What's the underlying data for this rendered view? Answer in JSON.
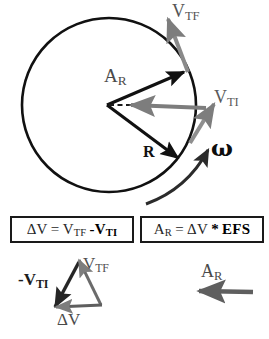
{
  "figure": {
    "background_color": "#ffffff"
  },
  "circle_diagram": {
    "labels": {
      "v_tf": {
        "base": "V",
        "sub": "TF",
        "color": "#555555"
      },
      "a_r": {
        "base": "A",
        "sub": "R",
        "color": "#4a4a4a"
      },
      "v_ti": {
        "base": "V",
        "sub": "TI",
        "color": "#5a5a5a"
      },
      "r": {
        "base": "R",
        "color": "#111111"
      },
      "omega": {
        "base": "ω",
        "color": "#0d0d0d"
      }
    },
    "geometry": {
      "circle_center_x": 108,
      "circle_center_y": 105,
      "circle_radius": 92,
      "vertex_x": 107,
      "vertex_y": 105
    },
    "colors": {
      "circle_stroke": "#111111",
      "radius_vector": "#111111",
      "tangential_velocity": "#7d7d7d",
      "acceleration_dashed": "#1a1a1a",
      "omega_arc": "#2b2b2b"
    }
  },
  "equations": [
    {
      "id": "delta-v",
      "parts": [
        {
          "text": "ΔV",
          "bold": false
        },
        {
          "text": "=",
          "bold": false
        },
        {
          "text": "V",
          "sub": "TF",
          "bold": false
        },
        {
          "text": "-V",
          "sub": "TI",
          "bold": true
        }
      ],
      "plain": "ΔV = V_TF - V_TI"
    },
    {
      "id": "a-r",
      "parts": [
        {
          "text": "A",
          "sub": "R",
          "bold": false
        },
        {
          "text": "=",
          "bold": false
        },
        {
          "text": "ΔV",
          "bold": false
        },
        {
          "text": "*",
          "bold": true
        },
        {
          "text": "EFS",
          "bold": true
        }
      ],
      "plain": "A_R = ΔV * EFS"
    }
  ],
  "triangle_diagram": {
    "labels": {
      "v_tf": {
        "base": "V",
        "sub": "TF",
        "color": "#4f4f4f"
      },
      "neg_v_ti": {
        "base": "-V",
        "sub": "TI",
        "color": "#1c1c1c"
      },
      "delta_v": {
        "base": "ΔV",
        "color": "#4a4a4a"
      }
    },
    "geometry": {
      "apex_x": 78,
      "apex_y": 261,
      "left_x": 54,
      "left_y": 306,
      "right_x": 101,
      "right_y": 304
    },
    "colors": {
      "neg_v_ti_edge": "#262626",
      "v_tf_edge": "#6b6b6b",
      "delta_v_edge": "#5e5e5e"
    }
  },
  "result_arrow": {
    "label": {
      "base": "A",
      "sub": "R",
      "color": "#4a4a4a"
    },
    "color": "#5f5f5f",
    "from_x": 252,
    "from_y": 292,
    "to_x": 198,
    "to_y": 291
  }
}
